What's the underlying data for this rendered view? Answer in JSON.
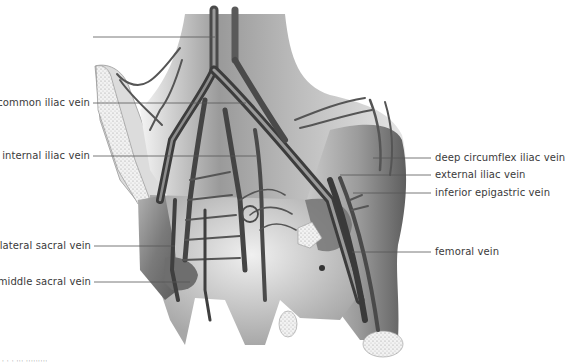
{
  "figure": {
    "labels_left": [
      {
        "id": "unlabeled-top",
        "text": ""
      },
      {
        "id": "common-iliac",
        "text": "common iliac vein"
      },
      {
        "id": "internal-iliac",
        "text": "internal iliac vein"
      },
      {
        "id": "lateral-sacral",
        "text": "lateral sacral vein"
      },
      {
        "id": "middle-sacral",
        "text": "middle sacral vein"
      }
    ],
    "labels_right": [
      {
        "id": "deep-circumflex-iliac",
        "text": "deep circumflex iliac vein"
      },
      {
        "id": "external-iliac",
        "text": "external iliac  vein"
      },
      {
        "id": "inferior-epigastric",
        "text": "inferior epigastric vein"
      },
      {
        "id": "femoral",
        "text": "femoral vein"
      }
    ],
    "footer": "· · ·  ··· ·········",
    "colors": {
      "label_text": "#3a3a3a",
      "leader_line": "#555555",
      "vein_dark": "#3c3c3c",
      "tissue_mid": "#8a8a8a",
      "tissue_light": "#d8d8d8",
      "bone": "#eeeeee"
    }
  }
}
